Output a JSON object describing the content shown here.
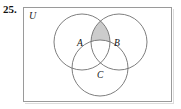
{
  "exercise": {
    "number": "25."
  },
  "diagram": {
    "kind": "three-set-venn-diagram",
    "universe_label": "U",
    "sets": [
      {
        "id": "A",
        "label": "A",
        "position": "upper-left"
      },
      {
        "id": "B",
        "label": "B",
        "position": "upper-right"
      },
      {
        "id": "C",
        "label": "C",
        "position": "bottom-center"
      }
    ],
    "shaded_region": {
      "description": "A intersect B, excluding C",
      "expression": "(A ∩ B) − C",
      "fill_color": "#cccccc"
    },
    "geometry": {
      "circle_a": {
        "cx": 59,
        "cy": 35,
        "r": 28
      },
      "circle_b": {
        "cx": 96,
        "cy": 35,
        "r": 28
      },
      "circle_c": {
        "cx": 77,
        "cy": 61,
        "r": 28
      }
    },
    "colors": {
      "stroke": "#6f6f6f",
      "box_border": "#9a9a9a",
      "shade": "#cccccc",
      "background": "#ffffff",
      "text": "#111111"
    }
  }
}
